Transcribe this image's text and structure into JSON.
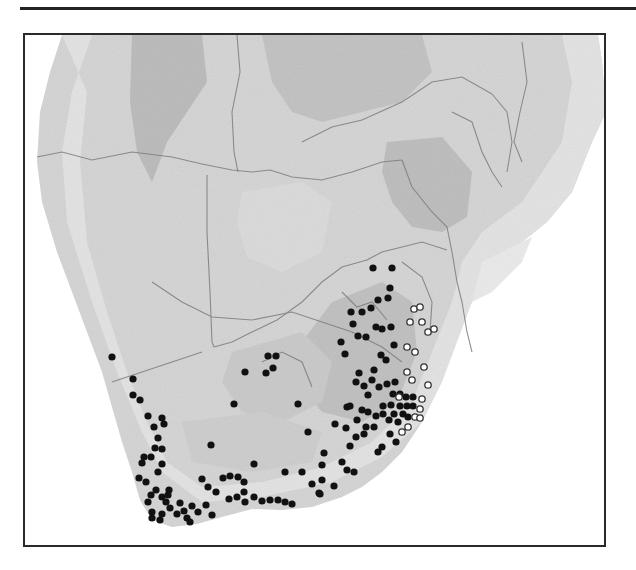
{
  "figure": {
    "type": "distribution-map",
    "region": "southern Africa",
    "colors": {
      "ocean": "#ffffff",
      "land_low": "#e2e2e2",
      "land_mid": "#c9c9c9",
      "land_high": "#b2b2b2",
      "borders": "#7d7d7d",
      "frame": "#2a2a2a",
      "filled_marker": "#111111",
      "open_marker_stroke": "#333333"
    },
    "legend": []
  },
  "markers": {
    "filled": [
      [
        110,
        355
      ],
      [
        131,
        377
      ],
      [
        131,
        393
      ],
      [
        138,
        398
      ],
      [
        146,
        414
      ],
      [
        160,
        416
      ],
      [
        152,
        425
      ],
      [
        162,
        422
      ],
      [
        156,
        436
      ],
      [
        153,
        446
      ],
      [
        160,
        447
      ],
      [
        142,
        455
      ],
      [
        149,
        455
      ],
      [
        140,
        461
      ],
      [
        160,
        462
      ],
      [
        156,
        470
      ],
      [
        137,
        476
      ],
      [
        144,
        480
      ],
      [
        154,
        488
      ],
      [
        149,
        493
      ],
      [
        160,
        495
      ],
      [
        166,
        493
      ],
      [
        164,
        500
      ],
      [
        168,
        506
      ],
      [
        146,
        500
      ],
      [
        150,
        510
      ],
      [
        160,
        512
      ],
      [
        158,
        518
      ],
      [
        175,
        512
      ],
      [
        185,
        516
      ],
      [
        150,
        516
      ],
      [
        167,
        488
      ],
      [
        178,
        501
      ],
      [
        182,
        509
      ],
      [
        190,
        504
      ],
      [
        196,
        510
      ],
      [
        204,
        503
      ],
      [
        188,
        520
      ],
      [
        210,
        513
      ],
      [
        200,
        477
      ],
      [
        206,
        485
      ],
      [
        221,
        476
      ],
      [
        228,
        474
      ],
      [
        236,
        475
      ],
      [
        242,
        480
      ],
      [
        252,
        462
      ],
      [
        242,
        490
      ],
      [
        252,
        495
      ],
      [
        260,
        499
      ],
      [
        268,
        498
      ],
      [
        276,
        498
      ],
      [
        283,
        500
      ],
      [
        290,
        502
      ],
      [
        283,
        470
      ],
      [
        300,
        470
      ],
      [
        320,
        463
      ],
      [
        310,
        482
      ],
      [
        317,
        491
      ],
      [
        209,
        443
      ],
      [
        214,
        490
      ],
      [
        227,
        497
      ],
      [
        235,
        495
      ],
      [
        243,
        500
      ],
      [
        243,
        370
      ],
      [
        266,
        354
      ],
      [
        271,
        366
      ],
      [
        264,
        371
      ],
      [
        274,
        354
      ],
      [
        232,
        402
      ],
      [
        296,
        402
      ],
      [
        306,
        430
      ],
      [
        322,
        451
      ],
      [
        345,
        405
      ],
      [
        362,
        432
      ],
      [
        349,
        310
      ],
      [
        360,
        310
      ],
      [
        351,
        322
      ],
      [
        356,
        334
      ],
      [
        364,
        335
      ],
      [
        339,
        340
      ],
      [
        343,
        352
      ],
      [
        357,
        371
      ],
      [
        369,
        306
      ],
      [
        376,
        298
      ],
      [
        386,
        296
      ],
      [
        388,
        286
      ],
      [
        371,
        266
      ],
      [
        390,
        266
      ],
      [
        379,
        353
      ],
      [
        372,
        368
      ],
      [
        384,
        358
      ],
      [
        392,
        343
      ],
      [
        374,
        325
      ],
      [
        380,
        327
      ],
      [
        389,
        325
      ],
      [
        354,
        380
      ],
      [
        362,
        384
      ],
      [
        370,
        378
      ],
      [
        366,
        393
      ],
      [
        377,
        385
      ],
      [
        385,
        382
      ],
      [
        393,
        380
      ],
      [
        381,
        404
      ],
      [
        389,
        403
      ],
      [
        381,
        412
      ],
      [
        392,
        412
      ],
      [
        398,
        404
      ],
      [
        401,
        412
      ],
      [
        405,
        404
      ],
      [
        387,
        418
      ],
      [
        396,
        420
      ],
      [
        391,
        392
      ],
      [
        398,
        392
      ],
      [
        404,
        395
      ],
      [
        411,
        395
      ],
      [
        411,
        404
      ],
      [
        406,
        415
      ],
      [
        348,
        404
      ],
      [
        360,
        408
      ],
      [
        366,
        410
      ],
      [
        355,
        418
      ],
      [
        364,
        425
      ],
      [
        372,
        425
      ],
      [
        374,
        414
      ],
      [
        333,
        422
      ],
      [
        344,
        426
      ],
      [
        348,
        444
      ],
      [
        354,
        435
      ],
      [
        340,
        460
      ],
      [
        345,
        468
      ],
      [
        352,
        470
      ],
      [
        388,
        432
      ],
      [
        394,
        440
      ],
      [
        376,
        450
      ],
      [
        380,
        445
      ],
      [
        320,
        478
      ],
      [
        318,
        492
      ],
      [
        332,
        484
      ]
    ],
    "open": [
      [
        412,
        307
      ],
      [
        418,
        305
      ],
      [
        420,
        320
      ],
      [
        408,
        320
      ],
      [
        426,
        330
      ],
      [
        432,
        327
      ],
      [
        405,
        345
      ],
      [
        413,
        350
      ],
      [
        422,
        365
      ],
      [
        405,
        370
      ],
      [
        410,
        378
      ],
      [
        426,
        383
      ],
      [
        397,
        395
      ],
      [
        420,
        397
      ],
      [
        418,
        407
      ],
      [
        413,
        415
      ],
      [
        406,
        425
      ],
      [
        400,
        430
      ],
      [
        418,
        416
      ]
    ]
  }
}
